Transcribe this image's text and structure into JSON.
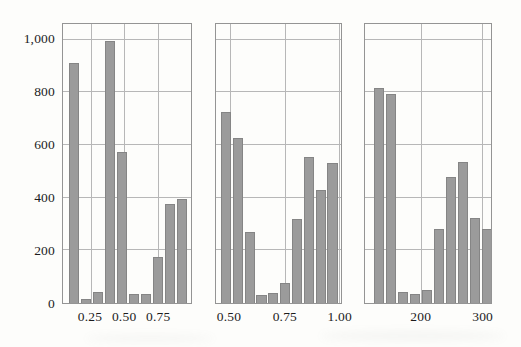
{
  "figure": {
    "kind": "trellis-histogram-figure",
    "title": "",
    "colors": {
      "background": "#fdfdfb",
      "bar_fill": "#9b9b9b",
      "bar_edge": "#858585",
      "gridline": "#b7b7b7",
      "frame": "#949494",
      "text": "#1c1c1c"
    },
    "layout": {
      "plot_top": 23,
      "plot_bottom": 304,
      "plot_height": 281,
      "panels": [
        {
          "left": 62,
          "width": 130
        },
        {
          "left": 215,
          "width": 127
        },
        {
          "left": 364,
          "width": 128
        }
      ]
    }
  },
  "y_axis": {
    "tick_labels": [
      "0",
      "200",
      "400",
      "600",
      "800",
      "1,000"
    ],
    "tick_values": [
      0,
      200,
      400,
      600,
      800,
      1000
    ],
    "label": "",
    "render_max": 1060
  },
  "chart_data": [
    {
      "type": "bar",
      "panel": "left",
      "title": "",
      "xlabel": "",
      "ylabel": "",
      "ylim": [
        0,
        1060
      ],
      "grid": true,
      "x_tick_labels": [
        "0.25",
        "0.50",
        "0.75"
      ],
      "x_tick_positions_pct": [
        21.5,
        47.8,
        74.0
      ],
      "bin_centers": [
        0.14,
        0.23,
        0.32,
        0.41,
        0.5,
        0.59,
        0.68,
        0.77,
        0.86,
        0.95
      ],
      "values": [
        910,
        16,
        40,
        995,
        573,
        34,
        34,
        176,
        376,
        396
      ],
      "bars": {
        "start_pct": 4.8,
        "pitch_pct": 9.4,
        "width_pct": 7.7
      }
    },
    {
      "type": "bar",
      "panel": "middle",
      "title": "",
      "xlabel": "",
      "ylabel": "",
      "ylim": [
        0,
        1060
      ],
      "grid": true,
      "x_tick_labels": [
        "0.50",
        "0.75",
        "1.00"
      ],
      "x_tick_positions_pct": [
        11.0,
        55.0,
        98.2
      ],
      "bin_centers": [
        0.48,
        0.54,
        0.59,
        0.64,
        0.7,
        0.75,
        0.81,
        0.86,
        0.92,
        0.97
      ],
      "values": [
        727,
        627,
        268,
        31,
        37,
        75,
        318,
        555,
        430,
        531
      ],
      "bars": {
        "start_pct": 3.9,
        "pitch_pct": 9.47,
        "width_pct": 8.1
      }
    },
    {
      "type": "bar",
      "panel": "right",
      "title": "",
      "xlabel": "",
      "ylabel": "",
      "ylim": [
        0,
        1060
      ],
      "grid": true,
      "x_tick_labels": [
        "200",
        "300"
      ],
      "x_tick_positions_pct": [
        44.3,
        92.7
      ],
      "bin_centers": [
        132,
        152,
        171,
        191,
        211,
        230,
        250,
        270,
        289,
        309
      ],
      "values": [
        818,
        795,
        42,
        34,
        50,
        282,
        480,
        534,
        322,
        280
      ],
      "bars": {
        "start_pct": 7.3,
        "pitch_pct": 9.49,
        "width_pct": 8.0
      }
    }
  ]
}
